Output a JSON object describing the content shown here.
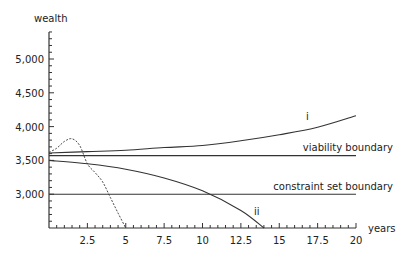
{
  "chart_data": {
    "type": "line",
    "title": "",
    "xlabel": "years",
    "ylabel": "wealth",
    "xlim": [
      0,
      20
    ],
    "ylim": [
      2500,
      5400
    ],
    "x_ticks": [
      2.5,
      5,
      7.5,
      10,
      12.5,
      15,
      17.5,
      20
    ],
    "x_tick_labels": [
      "2.5",
      "5",
      "7.5",
      "10",
      "12.5",
      "15",
      "17.5",
      "20"
    ],
    "y_ticks": [
      3000,
      3500,
      4000,
      4500,
      5000
    ],
    "y_tick_labels": [
      "3,000",
      "3,500",
      "4,000",
      "4,500",
      "5,000"
    ],
    "grid": false,
    "legend": null,
    "series": [
      {
        "name": "i",
        "style": "solid",
        "x": [
          0,
          2.5,
          5,
          7.5,
          10,
          12.5,
          15,
          17.5,
          20
        ],
        "values": [
          3610,
          3630,
          3650,
          3690,
          3720,
          3790,
          3880,
          3990,
          4160
        ]
      },
      {
        "name": "ii",
        "style": "solid",
        "x": [
          0,
          2.5,
          5,
          7.5,
          10,
          12.5,
          14
        ],
        "values": [
          3500,
          3450,
          3370,
          3240,
          3050,
          2760,
          2500
        ]
      },
      {
        "name": "dashed path",
        "style": "dashed",
        "x": [
          0,
          0.5,
          1,
          1.5,
          2,
          2.5,
          3,
          3.5,
          4,
          4.5,
          5
        ],
        "values": [
          3620,
          3680,
          3780,
          3820,
          3720,
          3450,
          3320,
          3180,
          2950,
          2720,
          2500
        ]
      },
      {
        "name": "viability boundary",
        "style": "solid",
        "x": [
          0,
          20
        ],
        "values": [
          3570,
          3570
        ]
      },
      {
        "name": "constraint set boundary",
        "style": "solid",
        "x": [
          0,
          20
        ],
        "values": [
          3000,
          3000
        ]
      }
    ],
    "annotations": [
      {
        "text": "i",
        "x": 17.2,
        "y": 4060
      },
      {
        "text": "ii",
        "x": 13.2,
        "y": 2690
      },
      {
        "text": "viability boundary",
        "x": 20,
        "y": 3650
      },
      {
        "text": "constraint set boundary",
        "x": 20,
        "y": 3080
      }
    ]
  },
  "labels": {
    "ylabel": "wealth",
    "xlabel": "years",
    "curve_i": "i",
    "curve_ii": "ii",
    "viability": "viability boundary",
    "constraint": "constraint set boundary"
  }
}
